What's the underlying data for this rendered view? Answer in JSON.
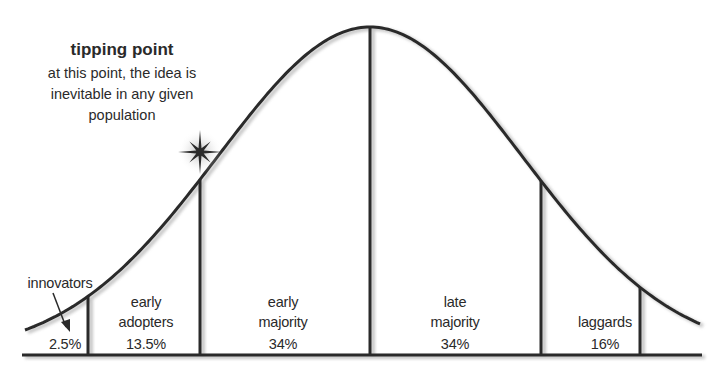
{
  "diagram": {
    "type": "bell-curve",
    "annotation": {
      "title": "tipping point",
      "lines": [
        "at this point, the idea is",
        "inevitable in any given",
        "population"
      ]
    },
    "segments": [
      {
        "name": "innovators",
        "label_lines": [],
        "percent": "2.5%",
        "share": 2.5
      },
      {
        "name": "early adopters",
        "label_lines": [
          "early",
          "adopters"
        ],
        "percent": "13.5%",
        "share": 13.5
      },
      {
        "name": "early majority",
        "label_lines": [
          "early",
          "majority"
        ],
        "percent": "34%",
        "share": 34
      },
      {
        "name": "late majority",
        "label_lines": [
          "late",
          "majority"
        ],
        "percent": "34%",
        "share": 34
      },
      {
        "name": "laggards",
        "label_lines": [
          "laggards"
        ],
        "percent": "16%",
        "share": 16
      }
    ],
    "callout_label": "innovators",
    "colors": {
      "ink": "#2a2a2a",
      "shadow": "#b8b8b8",
      "background": "#ffffff"
    }
  }
}
